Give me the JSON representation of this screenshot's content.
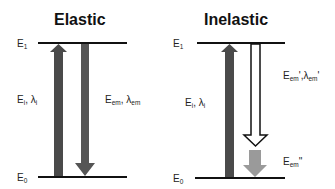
{
  "panels": [
    {
      "title": "Elastic",
      "levels": {
        "upper": "E",
        "upper_sub": "1",
        "lower": "E",
        "lower_sub": "0"
      },
      "excitation_label": {
        "e": "E",
        "e_sub": "i",
        "sep": ", ",
        "lambda": "λ",
        "lambda_sub": "i"
      },
      "emission_label": {
        "e": "E",
        "e_sub": "em",
        "sep": ", ",
        "lambda": "λ",
        "lambda_sub": "em"
      }
    },
    {
      "title": "Inelastic",
      "levels": {
        "upper": "E",
        "upper_sub": "1",
        "lower": "E",
        "lower_sub": "0"
      },
      "excitation_label": {
        "e": "E",
        "e_sub": "i",
        "sep": ", ",
        "lambda": "λ",
        "lambda_sub": "i"
      },
      "emission_label": {
        "e": "E",
        "e_sub": "em",
        "prime": "'",
        "sep": ",",
        "lambda": "λ",
        "lambda_sub": "em",
        "lambda_prime": "'"
      },
      "loss_label": {
        "e": "E",
        "e_sub": "em",
        "prime": "''"
      }
    }
  ],
  "colors": {
    "level_line": "#111111",
    "excitation_arrow": "#4a4a4a",
    "emission_arrow": "#555555",
    "hollow_arrow_stroke": "#111111",
    "loss_arrow": "#9a9a9a"
  }
}
